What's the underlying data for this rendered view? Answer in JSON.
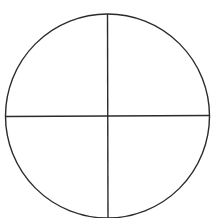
{
  "diagram": {
    "type": "circle-quadrants",
    "background": "#ffffff",
    "stroke_color": "#2b2b2b",
    "stroke_width": 1.4,
    "circle": {
      "cx": 107.5,
      "cy": 116,
      "r": 102
    },
    "lines": [
      {
        "name": "vertical-divider",
        "x1": 107.5,
        "y1": 14,
        "x2": 108,
        "y2": 218
      },
      {
        "name": "horizontal-divider",
        "x1": 6,
        "y1": 116.5,
        "x2": 209.5,
        "y2": 115.5
      }
    ],
    "quadrants": [
      "top-left",
      "top-right",
      "bottom-left",
      "bottom-right"
    ]
  }
}
